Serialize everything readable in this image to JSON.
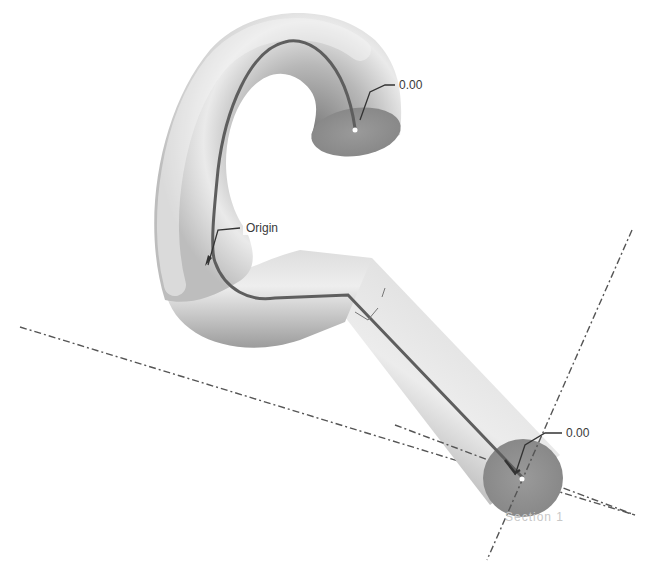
{
  "model": {
    "type": "swept tube",
    "surface_color": "#d9d9d9",
    "shadow_color": "#8a8a8a",
    "cap_color": "#8f8f8f",
    "path_line_color": "#5a5a5a",
    "axis_color": "#555555"
  },
  "labels": {
    "start_dimension": "0.00",
    "origin": "Origin",
    "end_dimension": "0.00",
    "section": "Section 1"
  }
}
